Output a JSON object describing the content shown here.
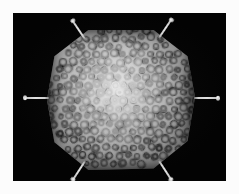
{
  "figure": {
    "modality": "cryo-electron-microscopy-surface-rendering",
    "caption": "",
    "background_color": "#030303",
    "margin_color": "#fcfcfc",
    "panel": {
      "x": 13,
      "y": 13,
      "width": 213,
      "height": 168
    }
  },
  "particle": {
    "name": "icosahedral-viral-capsid",
    "symmetry": "icosahedral",
    "silhouette": "hexagonal",
    "center": {
      "x": 108,
      "y": 87
    },
    "radius_x": 74,
    "radius_y": 73,
    "surface_color_bright": "#e8e8e8",
    "surface_color_mid": "#9a9a9a",
    "surface_color_dark": "#2e2e2e",
    "capsomer_type": "hexon-trimer-ring",
    "capsomer_count": 244,
    "lighting": "front-center-highlight"
  },
  "fibers": {
    "label": "penton-fiber-spikes",
    "color": "#d8d8d8",
    "count": 6,
    "items": [
      {
        "name": "fiber-left",
        "x": 36,
        "y": 85,
        "angle": 180,
        "length": 24
      },
      {
        "name": "fiber-right",
        "x": 181,
        "y": 85,
        "angle": 0,
        "length": 24
      },
      {
        "name": "fiber-upper-left",
        "x": 72,
        "y": 26,
        "angle": 236,
        "length": 22
      },
      {
        "name": "fiber-upper-right",
        "x": 146,
        "y": 25,
        "angle": 304,
        "length": 22
      },
      {
        "name": "fiber-lower-left",
        "x": 72,
        "y": 148,
        "angle": 123,
        "length": 22
      },
      {
        "name": "fiber-lower-right",
        "x": 146,
        "y": 148,
        "angle": 57,
        "length": 22
      }
    ]
  }
}
